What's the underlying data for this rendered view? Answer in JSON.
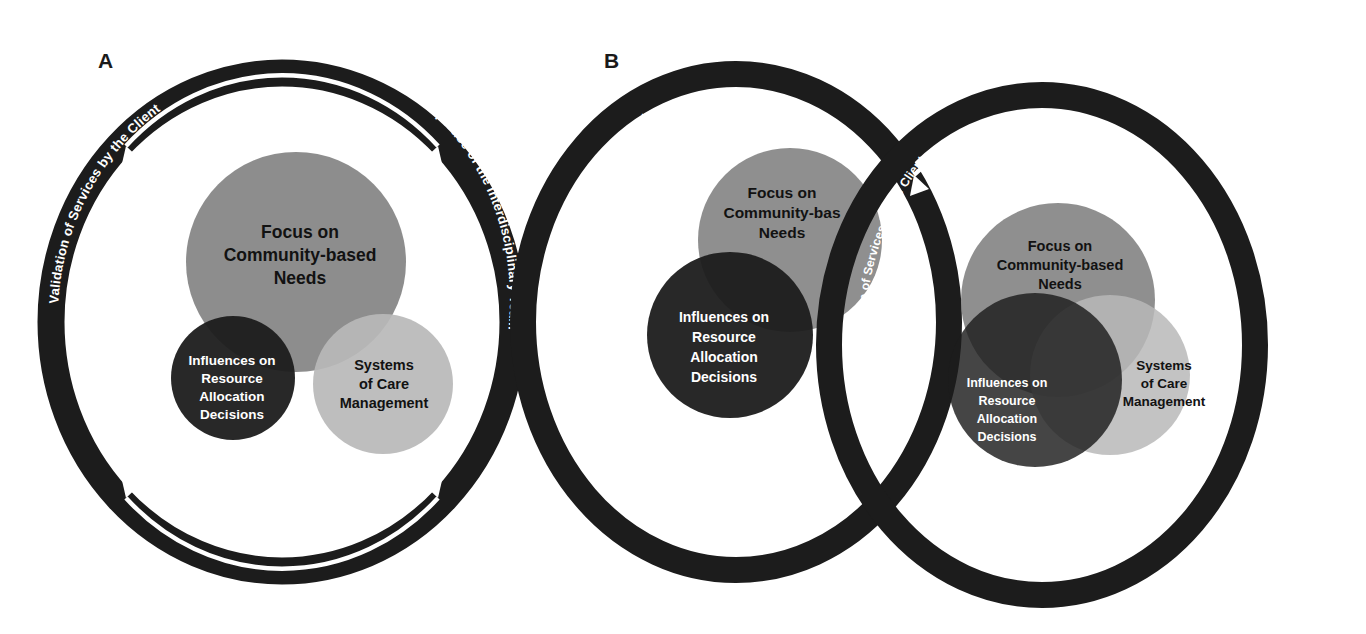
{
  "figure": {
    "background": "#ffffff",
    "panels": [
      {
        "id": "A",
        "label": "A",
        "rings": [
          {
            "id": "A-ring",
            "left_text": "Validation of Services by the Client",
            "right_text": "Expertise of the Interdisciplinary Team",
            "color": "#1c1c1c",
            "arrow_color": "#ffffff"
          }
        ],
        "bubbles": [
          {
            "id": "focus",
            "label": "Focus on\nCommunity-based\nNeeds",
            "lines": [
              "Focus on",
              "Community-based",
              "Needs"
            ],
            "color": "#838383",
            "text_color": "#121212"
          },
          {
            "id": "influences",
            "label": "Influences on\nResource\nAllocation\nDecisions",
            "lines": [
              "Influences on",
              "Resource",
              "Allocation",
              "Decisions"
            ],
            "color": "#1c1c1c",
            "text_color": "#ffffff"
          },
          {
            "id": "systems",
            "label": "Systems\nof Care\nManagement",
            "lines": [
              "Systems",
              "of Care",
              "Management"
            ],
            "color": "#b9b9b9",
            "text_color": "#121212"
          }
        ]
      },
      {
        "id": "B",
        "label": "B",
        "rings": [
          {
            "id": "B-ring-left",
            "left_text": "Validation of Services by the Client",
            "right_text": "Validation of Services by the Client",
            "color": "#1c1c1c",
            "arrow_color": "#ffffff"
          },
          {
            "id": "B-ring-right",
            "left_text": "Validation of Services by the Client",
            "right_text": "Expertise of the Interdisciplinary Team",
            "color": "#1c1c1c",
            "arrow_color": "#ffffff"
          }
        ],
        "group_left_bubbles": [
          {
            "id": "focus",
            "lines": [
              "Focus on",
              "Community-bas",
              "Needs"
            ],
            "color": "#838383",
            "text_color": "#121212"
          },
          {
            "id": "influences",
            "lines": [
              "Influences on",
              "Resource",
              "Allocation",
              "Decisions"
            ],
            "color": "#1c1c1c",
            "text_color": "#ffffff"
          }
        ],
        "group_right_bubbles": [
          {
            "id": "focus",
            "lines": [
              "Focus on",
              "Community-based",
              "Needs"
            ],
            "color": "#838383",
            "text_color": "#121212"
          },
          {
            "id": "influences",
            "lines": [
              "Influences on",
              "Resource",
              "Allocation",
              "Decisions"
            ],
            "color": "#1c1c1c",
            "text_color": "#ffffff"
          },
          {
            "id": "systems",
            "lines": [
              "Systems",
              "of Care",
              "Management"
            ],
            "color": "#b9b9b9",
            "text_color": "#121212"
          }
        ]
      }
    ],
    "palette": {
      "ring": "#1c1c1c",
      "arrow": "#ffffff",
      "bubble_mid_gray": "#838383",
      "bubble_dark": "#1c1c1c",
      "bubble_light_gray": "#b9b9b9",
      "label_dark": "#121212",
      "label_light": "#ffffff"
    }
  }
}
